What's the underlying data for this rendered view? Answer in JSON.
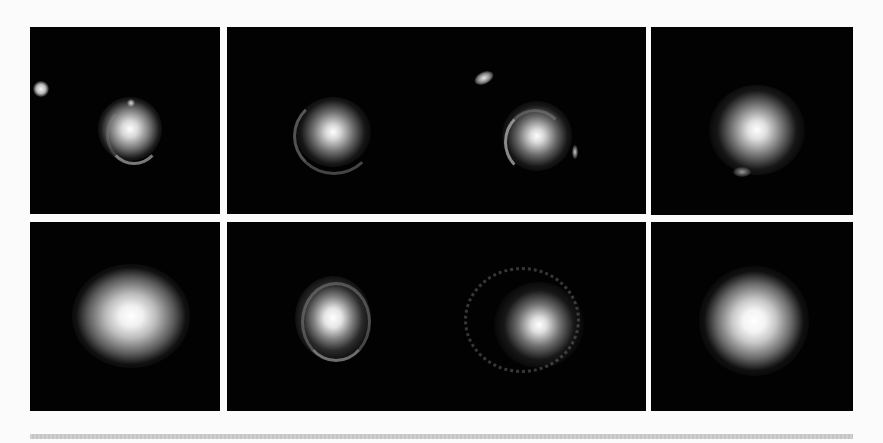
{
  "figure": {
    "rows": 2,
    "cols": 4,
    "background_color": "#fbfbfb",
    "panel_color": "#020202",
    "panels": [
      {
        "id": "r1c1",
        "row": 1,
        "col": 1,
        "features": "central galaxy with partial Einstein ring, bright companion at left edge"
      },
      {
        "id": "r1c2",
        "row": 1,
        "col": 2,
        "features": "central galaxy with faint arc on left and lower ring"
      },
      {
        "id": "r1c3",
        "row": 1,
        "col": 3,
        "features": "central galaxy with left arc, small elongated galaxy upper-left"
      },
      {
        "id": "r1c4",
        "row": 1,
        "col": 4,
        "features": "diffuse central galaxy with faint lower arc"
      },
      {
        "id": "r2c1",
        "row": 2,
        "col": 1,
        "features": "large bright elliptical galaxy"
      },
      {
        "id": "r2c2",
        "row": 2,
        "col": 2,
        "features": "compact galaxy with complete ring"
      },
      {
        "id": "r2c3",
        "row": 2,
        "col": 3,
        "features": "galaxy with clumpy partial ring"
      },
      {
        "id": "r2c4",
        "row": 2,
        "col": 4,
        "features": "bright diffuse elliptical galaxy"
      }
    ]
  }
}
